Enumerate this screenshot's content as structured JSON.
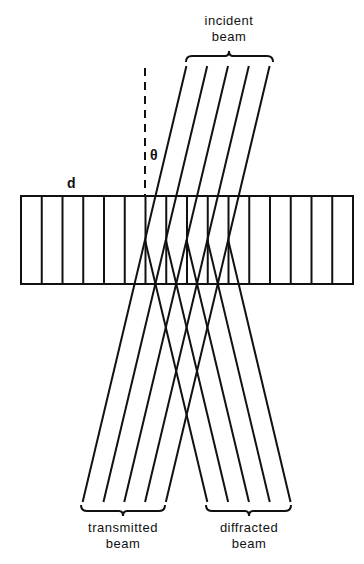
{
  "diagram": {
    "type": "crystal-diffraction-schematic",
    "labels": {
      "incident_line1": "incident",
      "incident_line2": "beam",
      "transmitted_line1": "transmitted",
      "transmitted_line2": "beam",
      "diffracted_line1": "diffracted",
      "diffracted_line2": "beam",
      "spacing": "d",
      "angle": "θ"
    },
    "beam_count": 5,
    "lattice_plane_count": 17,
    "colors": {
      "ink": "#111111",
      "background": "#ffffff"
    }
  }
}
